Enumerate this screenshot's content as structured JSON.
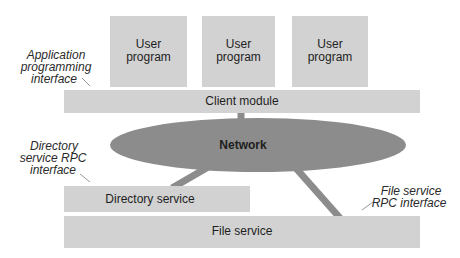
{
  "diagram": {
    "user_programs": [
      {
        "line1": "User",
        "line2": "program"
      },
      {
        "line1": "User",
        "line2": "program"
      },
      {
        "line1": "User",
        "line2": "program"
      }
    ],
    "client_module": "Client module",
    "network": "Network",
    "directory_service": "Directory service",
    "file_service": "File service",
    "annotations": {
      "api": [
        "Application",
        "programming",
        "interface"
      ],
      "directory_rpc": [
        "Directory",
        "service  RPC",
        "interface"
      ],
      "file_rpc": [
        "File service",
        "RPC interface"
      ]
    },
    "colors": {
      "box_fill": "#d2d2d2",
      "network_fill": "#8c8c8c",
      "text": "#1e1e1e"
    }
  }
}
